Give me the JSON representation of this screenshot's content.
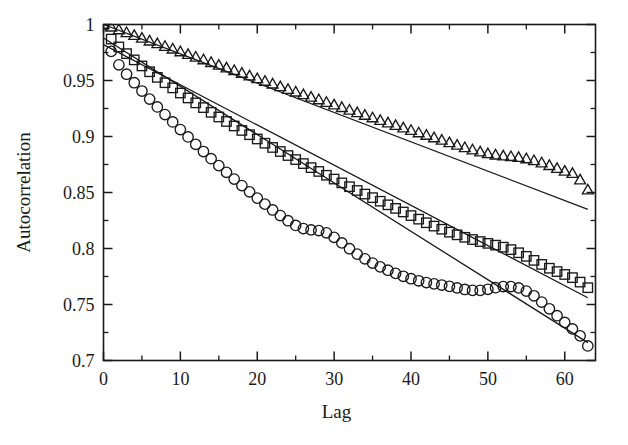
{
  "chart_data": {
    "type": "scatter",
    "title": "",
    "xlabel": "Lag",
    "ylabel": "Autocorrelation",
    "xlim": [
      0,
      64
    ],
    "ylim": [
      0.7,
      1.0
    ],
    "grid": false,
    "legend_position": "none",
    "x_ticks": [
      0,
      10,
      20,
      30,
      40,
      50,
      60
    ],
    "x_tick_labels": [
      "0",
      "10",
      "20",
      "30",
      "40",
      "50",
      "60"
    ],
    "x_minor_ticks": [
      5,
      15,
      25,
      35,
      45,
      55
    ],
    "y_ticks": [
      0.7,
      0.75,
      0.8,
      0.85,
      0.9,
      0.95,
      1.0
    ],
    "y_tick_labels": [
      "0.7",
      "0.75",
      "0.8",
      "0.85",
      "0.9",
      "0.95",
      "1"
    ],
    "y_minor_ticks": [
      0.725,
      0.775,
      0.825,
      0.875,
      0.925,
      0.975
    ],
    "x": [
      0,
      1,
      2,
      3,
      4,
      5,
      6,
      7,
      8,
      9,
      10,
      11,
      12,
      13,
      14,
      15,
      16,
      17,
      18,
      19,
      20,
      21,
      22,
      23,
      24,
      25,
      26,
      27,
      28,
      29,
      30,
      31,
      32,
      33,
      34,
      35,
      36,
      37,
      38,
      39,
      40,
      41,
      42,
      43,
      44,
      45,
      46,
      47,
      48,
      49,
      50,
      51,
      52,
      53,
      54,
      55,
      56,
      57,
      58,
      59,
      60,
      61,
      62,
      63
    ],
    "series": [
      {
        "name": "triangle-series",
        "marker": "triangle",
        "values": [
          1.0,
          0.9975,
          0.995,
          0.9925,
          0.99,
          0.9875,
          0.985,
          0.9826,
          0.9802,
          0.9778,
          0.9754,
          0.973,
          0.9706,
          0.9682,
          0.9658,
          0.9634,
          0.961,
          0.9586,
          0.9562,
          0.9538,
          0.9514,
          0.949,
          0.9466,
          0.9442,
          0.9418,
          0.9394,
          0.9371,
          0.9348,
          0.9325,
          0.9302,
          0.9279,
          0.9256,
          0.9233,
          0.921,
          0.9187,
          0.9164,
          0.9141,
          0.9118,
          0.9096,
          0.9074,
          0.9052,
          0.903,
          0.9008,
          0.8986,
          0.8964,
          0.8942,
          0.892,
          0.8898,
          0.8878,
          0.886,
          0.8844,
          0.8832,
          0.8824,
          0.8818,
          0.881,
          0.8798,
          0.8782,
          0.8762,
          0.8738,
          0.8712,
          0.8688,
          0.8668,
          0.861,
          0.852
        ],
        "fit_line": {
          "x0": 0,
          "y0": 1.0,
          "x1": 63,
          "y1": 0.835
        }
      },
      {
        "name": "square-series",
        "marker": "square",
        "values": [
          1.0,
          0.987,
          0.98,
          0.974,
          0.9684,
          0.963,
          0.9578,
          0.9528,
          0.948,
          0.9434,
          0.9388,
          0.9344,
          0.93,
          0.9258,
          0.9216,
          0.9174,
          0.9134,
          0.9094,
          0.9054,
          0.9016,
          0.8978,
          0.894,
          0.8902,
          0.8866,
          0.883,
          0.8794,
          0.8758,
          0.8722,
          0.8688,
          0.8654,
          0.862,
          0.8586,
          0.8552,
          0.8518,
          0.8486,
          0.8454,
          0.8422,
          0.839,
          0.8358,
          0.8326,
          0.8294,
          0.8262,
          0.823,
          0.82,
          0.8172,
          0.8146,
          0.8122,
          0.81,
          0.808,
          0.8062,
          0.8046,
          0.803,
          0.8012,
          0.799,
          0.7962,
          0.793,
          0.7894,
          0.7858,
          0.7824,
          0.7794,
          0.7768,
          0.774,
          0.77,
          0.765
        ],
        "fit_line": {
          "x0": 0,
          "y0": 0.982,
          "x1": 63,
          "y1": 0.756
        }
      },
      {
        "name": "circle-series",
        "marker": "circle",
        "values": [
          1.0,
          0.976,
          0.964,
          0.9556,
          0.948,
          0.9406,
          0.9334,
          0.9264,
          0.9196,
          0.913,
          0.9062,
          0.8996,
          0.893,
          0.8866,
          0.8802,
          0.874,
          0.868,
          0.862,
          0.8562,
          0.8506,
          0.845,
          0.8396,
          0.8344,
          0.8294,
          0.8248,
          0.8206,
          0.8178,
          0.8166,
          0.816,
          0.814,
          0.81,
          0.805,
          0.7998,
          0.795,
          0.7908,
          0.787,
          0.7836,
          0.7806,
          0.7778,
          0.7752,
          0.773,
          0.7712,
          0.7696,
          0.7684,
          0.7674,
          0.7662,
          0.7648,
          0.7634,
          0.7626,
          0.7626,
          0.7636,
          0.765,
          0.766,
          0.766,
          0.7648,
          0.762,
          0.7578,
          0.7522,
          0.7462,
          0.74,
          0.734,
          0.7282,
          0.722,
          0.713
        ],
        "fit_line": {
          "x0": 0,
          "y0": 0.988,
          "x1": 63,
          "y1": 0.716
        }
      }
    ]
  }
}
